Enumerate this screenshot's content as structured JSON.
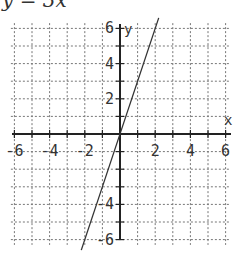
{
  "title": "y = 3x",
  "chart_data": {
    "type": "line",
    "title": "y = 3x",
    "xlabel": "x",
    "ylabel": "y",
    "xlim": [
      -6,
      6
    ],
    "ylim": [
      -6,
      6
    ],
    "grid": true,
    "x_ticks": [
      -6,
      -4,
      -2,
      2,
      4,
      6
    ],
    "y_ticks": [
      -6,
      -4,
      2,
      4,
      6
    ],
    "y_tick_labels_visible": [
      "6",
      "4",
      "2",
      "-4",
      "-6"
    ],
    "x_tick_labels": [
      "-6",
      "-4",
      "-2",
      "2",
      "4",
      "6"
    ],
    "series": [
      {
        "name": "y = 3x",
        "x": [
          -2.2,
          2.2
        ],
        "y": [
          -6.6,
          6.6
        ],
        "color": "#333333"
      }
    ]
  },
  "labels": {
    "x_axis": "x",
    "y_axis": "y",
    "xt": [
      "-6",
      "-4",
      "-2",
      "2",
      "4",
      "6"
    ],
    "yt": [
      "6",
      "4",
      "2",
      "-4",
      "-6"
    ]
  }
}
